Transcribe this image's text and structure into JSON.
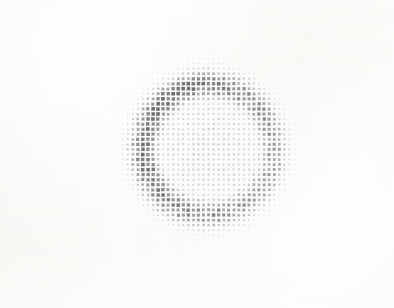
{
  "page": {
    "kind": "scanned-document-page",
    "background_color": "#f8f8f6",
    "width": 394,
    "height": 308
  },
  "ghost_text": {
    "description": "illegible faint bleed-through text from reverse of page, left margin",
    "legible": false,
    "color": "#d9d9d4",
    "lines": [
      "— ——— ——",
      "",
      "——— ———",
      "———— ——",
      "——— ————",
      "———— ——",
      "—— ————",
      "———— ———",
      "——— ——",
      "",
      "———— ——",
      "—— ————",
      "———— ———",
      "——— ———",
      "———— ——",
      "—— ———",
      "——— ————"
    ]
  },
  "chart_data": {
    "type": "heatmap",
    "title": "",
    "subtitle": "",
    "xlabel": "",
    "ylabel": "",
    "legend": [],
    "annotations": [],
    "grid": false,
    "render_style": "hinton-dot-matrix",
    "marker_shape": "square",
    "grid_geometry": {
      "origin_x": 52,
      "origin_y": 8,
      "pitch_x": 5.05,
      "pitch_y": 5.05,
      "cols": 65,
      "rows": 57
    },
    "value_encoding": {
      "min_value": 0.0,
      "max_value": 1.0,
      "min_marker_px": 0.9,
      "max_marker_px": 3.6,
      "min_color": "#eeeeea",
      "max_color": "#6e6e72"
    },
    "field_model": {
      "shape": "annulus",
      "center_col": 31,
      "center_row": 28,
      "ring_radius_cells": 12.8,
      "ring_width_cells": 3.6,
      "ring_peak_value": 1.0,
      "interior_value": 0.34,
      "background_value": 0.07,
      "background_falloff_cells": 26,
      "azimuth_gain": {
        "description": "ring darkness varies with angle; upper-left arc darkest, right arc lighter",
        "peak_angle_deg": 200,
        "modulation": 0.3
      }
    },
    "axis_ranges": {
      "xlim": [
        0,
        65
      ],
      "ylim": [
        0,
        57
      ]
    }
  }
}
